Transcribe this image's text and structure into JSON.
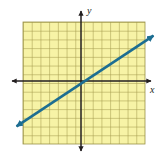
{
  "figure": {
    "name": "coordinate-plane-line-graph",
    "width": 162,
    "height": 162,
    "background_color": "#ffffff"
  },
  "axes": {
    "x_label": "x",
    "y_label": "y",
    "axis_color": "#231f20",
    "origin_px": [
      81,
      81
    ],
    "x_axis_y_px": 81,
    "y_axis_x_px": 81,
    "x_arrow_left_px": [
      10,
      81
    ],
    "x_arrow_right_px": [
      153,
      81
    ],
    "y_arrow_top_px": [
      81,
      9
    ],
    "y_arrow_bottom_px": [
      81,
      153
    ],
    "arrowheads": "both-ends-both-axes",
    "tick_labels": [],
    "tick_marks": false
  },
  "grid": {
    "background_color": "#f7f4a8",
    "line_color": "#9c9448",
    "minor_line_color": "#c9c276",
    "left_px": 23,
    "top_px": 22,
    "right_px": 145,
    "bottom_px": 144,
    "cell_size_px": 8.714,
    "columns": 14,
    "rows": 14,
    "x_range": [
      -6.65,
      7.35
    ],
    "y_range": [
      -7.23,
      6.77
    ]
  },
  "chart_data": {
    "type": "line",
    "title": "",
    "subtitle": "",
    "xlabel": "x",
    "ylabel": "y",
    "grid": true,
    "legend": "none",
    "xlim": [
      -6.65,
      7.35
    ],
    "ylim": [
      -7.23,
      6.77
    ],
    "series": [
      {
        "name": "line",
        "color": "#1d6e92",
        "style": "solid",
        "line_width_px": 2.6,
        "arrows": "both",
        "slope": 0.6667,
        "y_intercept": 0,
        "equation": "y = (2/3)x",
        "points": [
          {
            "x": -7.7,
            "y": -5.2
          },
          {
            "x": -3,
            "y": -2
          },
          {
            "x": 0,
            "y": 0
          },
          {
            "x": 3,
            "y": 2
          },
          {
            "x": 8.6,
            "y": 5.4
          }
        ],
        "endpoints_px": [
          [
            14,
            128
          ],
          [
            156,
            34
          ]
        ]
      }
    ]
  }
}
